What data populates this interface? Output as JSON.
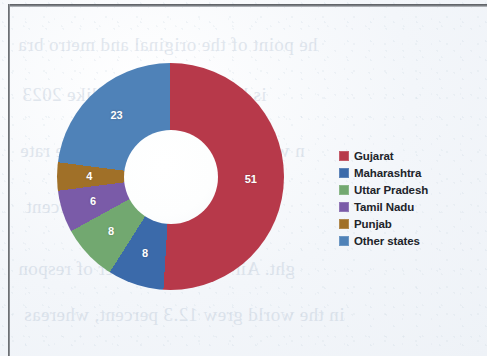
{
  "page": {
    "background_color": "#f3f6fa",
    "bleed_through_lines": [
      "he point of the original and metro bra",
      "is because that cities like 2023",
      "n was about the growth and the rate",
      "percent",
      "ght. Air with the number of respon",
      "in the world grew 12.3 percent, whereas"
    ]
  },
  "legend": {
    "position": "right",
    "items": [
      {
        "label": "Gujarat",
        "color": "#b7394a",
        "icon": "legend-swatch-icon"
      },
      {
        "label": "Maharashtra",
        "color": "#3b6aaa",
        "icon": "legend-swatch-icon"
      },
      {
        "label": "Uttar Pradesh",
        "color": "#72a870",
        "icon": "legend-swatch-icon"
      },
      {
        "label": "Tamil Nadu",
        "color": "#7a5ba8",
        "icon": "legend-swatch-icon"
      },
      {
        "label": "Punjab",
        "color": "#a07028",
        "icon": "legend-swatch-icon"
      },
      {
        "label": "Other states",
        "color": "#4f82b8",
        "icon": "legend-swatch-icon"
      }
    ]
  },
  "chart_data": {
    "type": "pie",
    "variant": "donut",
    "title": "",
    "subtitle": "",
    "xlabel": "",
    "ylabel": "",
    "grid": false,
    "legend_position": "right",
    "start_angle_deg": 0,
    "direction": "clockwise",
    "inner_radius_ratio": 0.42,
    "value_unit": "percent",
    "total": 100,
    "categories": [
      "Gujarat",
      "Maharashtra",
      "Uttar Pradesh",
      "Tamil Nadu",
      "Punjab",
      "Other states"
    ],
    "values": [
      51,
      8,
      8,
      6,
      4,
      23
    ],
    "colors": [
      "#b7394a",
      "#3b6aaa",
      "#72a870",
      "#7a5ba8",
      "#a07028",
      "#4f82b8"
    ],
    "data_labels": [
      "51",
      "8",
      "8",
      "6",
      "4",
      "23"
    ],
    "data_label_color": "#ffffff",
    "slices": [
      {
        "name": "Gujarat",
        "value": 51,
        "label": "51",
        "color": "#b7394a",
        "start_deg": 0.0,
        "end_deg": 183.6
      },
      {
        "name": "Maharashtra",
        "value": 8,
        "label": "8",
        "color": "#3b6aaa",
        "start_deg": 183.6,
        "end_deg": 212.4
      },
      {
        "name": "Uttar Pradesh",
        "value": 8,
        "label": "8",
        "color": "#72a870",
        "start_deg": 212.4,
        "end_deg": 241.2
      },
      {
        "name": "Tamil Nadu",
        "value": 6,
        "label": "6",
        "color": "#7a5ba8",
        "start_deg": 241.2,
        "end_deg": 262.8
      },
      {
        "name": "Punjab",
        "value": 4,
        "label": "4",
        "color": "#a07028",
        "start_deg": 262.8,
        "end_deg": 277.2
      },
      {
        "name": "Other states",
        "value": 23,
        "label": "23",
        "color": "#4f82b8",
        "start_deg": 277.2,
        "end_deg": 360.0
      }
    ]
  }
}
